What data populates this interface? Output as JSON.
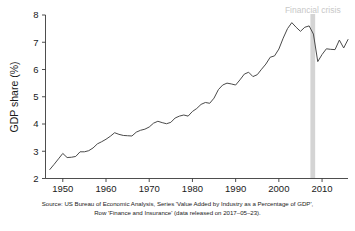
{
  "chart_data": {
    "type": "line",
    "title": "",
    "xlabel": "",
    "ylabel": "GDP share (%)",
    "xlim": [
      1946,
      2016
    ],
    "ylim": [
      2,
      8
    ],
    "grid": false,
    "legend": "none",
    "xticks": [
      "1950",
      "1960",
      "1970",
      "1980",
      "1990",
      "2000",
      "2010"
    ],
    "xtick_values": [
      1950,
      1960,
      1970,
      1980,
      1990,
      2000,
      2010
    ],
    "yticks": [
      "2",
      "3",
      "4",
      "5",
      "6",
      "7",
      "8"
    ],
    "ytick_values": [
      2,
      3,
      4,
      5,
      6,
      7,
      8
    ],
    "series": [
      {
        "name": "Finance and Insurance share of GDP",
        "x": [
          1947,
          1948,
          1949,
          1950,
          1951,
          1952,
          1953,
          1954,
          1955,
          1956,
          1957,
          1958,
          1959,
          1960,
          1961,
          1962,
          1963,
          1964,
          1965,
          1966,
          1967,
          1968,
          1969,
          1970,
          1971,
          1972,
          1973,
          1974,
          1975,
          1976,
          1977,
          1978,
          1979,
          1980,
          1981,
          1982,
          1983,
          1984,
          1985,
          1986,
          1987,
          1988,
          1989,
          1990,
          1991,
          1992,
          1993,
          1994,
          1995,
          1996,
          1997,
          1998,
          1999,
          2000,
          2001,
          2002,
          2003,
          2004,
          2005,
          2006,
          2007,
          2008,
          2009,
          2010,
          2011,
          2012,
          2013,
          2014,
          2015,
          2016
        ],
        "values": [
          2.33,
          2.52,
          2.72,
          2.92,
          2.77,
          2.78,
          2.81,
          2.98,
          2.98,
          3.02,
          3.12,
          3.27,
          3.35,
          3.44,
          3.55,
          3.68,
          3.62,
          3.58,
          3.57,
          3.56,
          3.7,
          3.77,
          3.81,
          3.89,
          4.03,
          4.1,
          4.05,
          4.01,
          4.06,
          4.22,
          4.29,
          4.33,
          4.29,
          4.46,
          4.57,
          4.72,
          4.79,
          4.76,
          4.95,
          5.26,
          5.43,
          5.5,
          5.47,
          5.43,
          5.62,
          5.83,
          5.9,
          5.74,
          5.81,
          6.01,
          6.2,
          6.45,
          6.5,
          6.75,
          7.15,
          7.5,
          7.72,
          7.55,
          7.4,
          7.55,
          7.6,
          7.3,
          6.29,
          6.55,
          6.76,
          6.74,
          6.73,
          7.08,
          6.79,
          7.1
        ]
      }
    ],
    "annotations": [
      {
        "name": "financial-crisis",
        "label": "Financial crisis",
        "type": "vspan",
        "x_start": 2007.3,
        "x_end": 2008.4,
        "color": "#d4d4d4",
        "label_color": "#c8c8c8"
      }
    ],
    "source_line1": "Source: US Bureau of Economic Analysis, Series 'Value Added by Industry as a Percentage of GDP',",
    "source_line2": "Row 'Finance and Insurance' (data released on 2017–05–23)."
  },
  "axis": {
    "ylabel": "GDP share (%)"
  },
  "colors": {
    "line": "#4a4a4a",
    "axis": "#3a3a3a",
    "crisis_band": "#d4d4d4",
    "crisis_label": "#c8c8c8",
    "background": "#ffffff",
    "text": "#1a1a1a"
  }
}
